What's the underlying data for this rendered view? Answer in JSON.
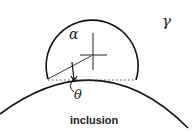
{
  "diagram": {
    "labels": {
      "alpha": "α",
      "gamma": "γ",
      "theta": "θ",
      "inclusion": "inclusion"
    },
    "elements": {
      "droplet": "partial circle resting on inclusion surface",
      "inclusion_surface": "large arc",
      "contact_line": "dotted chord between contact points",
      "center_mark": "crosshair at droplet center",
      "angle": "contact angle θ"
    }
  }
}
